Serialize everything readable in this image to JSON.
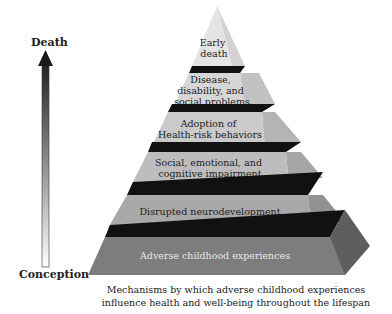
{
  "timeline": {
    "top_label": "Death",
    "bottom_label": "Conception",
    "arrow_direction": "up",
    "gradient": {
      "bottom": "#ffffff",
      "top": "#222222"
    }
  },
  "pyramid": {
    "layers": [
      {
        "lines": [
          "Early",
          "death"
        ],
        "front_color": "#e4e4e4",
        "side_color": "#d2d2d2",
        "text_color": "#222222"
      },
      {
        "lines": [
          "Disease,",
          "disability, and",
          "social problems"
        ],
        "front_color": "#d6d6d6",
        "side_color": "#c2c2c2",
        "text_color": "#222222"
      },
      {
        "lines": [
          "Adoption of",
          "Health-risk behaviors"
        ],
        "front_color": "#cacaca",
        "side_color": "#b4b4b4",
        "text_color": "#222222"
      },
      {
        "lines": [
          "Social, emotional, and",
          "cognitive impairment"
        ],
        "front_color": "#bdbdbd",
        "side_color": "#a6a6a6",
        "text_color": "#222222"
      },
      {
        "lines": [
          "Disrupted neurodevelopment"
        ],
        "front_color": "#a9a9a9",
        "side_color": "#929292",
        "text_color": "#222222"
      },
      {
        "lines": [
          "Adverse childhood experiences"
        ],
        "front_color": "#7d7d7d",
        "side_color": "#5e5e5e",
        "text_color": "#e8e8e8"
      }
    ],
    "separator_color": "#111111"
  },
  "caption": {
    "line1": "Mechanisms by which adverse childhood experiences",
    "line2": "influence health and well-being throughout the lifespan"
  }
}
